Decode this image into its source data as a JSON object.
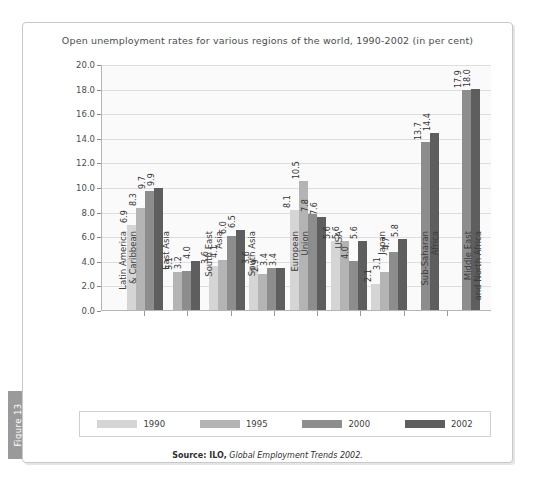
{
  "figure_tab": {
    "label": "Figure 13"
  },
  "source": {
    "lead": "Source: ILO,",
    "italic": "Global Employment Trends 2002."
  },
  "legend": {
    "items": [
      {
        "label": "1990",
        "color": "#d5d5d5"
      },
      {
        "label": "1995",
        "color": "#b4b4b4"
      },
      {
        "label": "2000",
        "color": "#8d8d8d"
      },
      {
        "label": "2002",
        "color": "#5e5e5e"
      }
    ]
  },
  "chart_data": {
    "type": "bar",
    "title": "Open unemployment rates for various regions of the world, 1990-2002 (in per cent)",
    "xlabel": "",
    "ylabel": "",
    "ylim": [
      0,
      20
    ],
    "ytick_step": 2,
    "grid": true,
    "legend_position": "bottom",
    "yticks": [
      "0.0",
      "2.0",
      "4.0",
      "6.0",
      "8.0",
      "10.0",
      "12.0",
      "14.0",
      "16.0",
      "18.0",
      "20.0"
    ],
    "categories": [
      {
        "line1": "Latin America",
        "line2": "& Caribbean"
      },
      {
        "line1": "East Asia",
        "line2": ""
      },
      {
        "line1": "South East",
        "line2": "Asia"
      },
      {
        "line1": "South Asia",
        "line2": ""
      },
      {
        "line1": "European",
        "line2": "Union"
      },
      {
        "line1": "USA",
        "line2": ""
      },
      {
        "line1": "Japan",
        "line2": ""
      },
      {
        "line1": "Sub-Saharan",
        "line2": "Africa"
      },
      {
        "line1": "Middle East",
        "line2": "and North Africa"
      }
    ],
    "series": [
      {
        "name": "1990",
        "color": "#d5d5d5",
        "values": [
          6.9,
          null,
          3.6,
          3.6,
          8.1,
          5.6,
          2.1,
          null,
          null
        ]
      },
      {
        "name": "1995",
        "color": "#b4b4b4",
        "values": [
          8.3,
          3.1,
          4.1,
          2.9,
          10.5,
          5.6,
          3.1,
          null,
          null
        ]
      },
      {
        "name": "2000",
        "color": "#8d8d8d",
        "values": [
          9.7,
          3.2,
          6.0,
          3.4,
          7.8,
          4.0,
          4.7,
          13.7,
          17.9
        ]
      },
      {
        "name": "2002",
        "color": "#5e5e5e",
        "values": [
          9.9,
          4.0,
          6.5,
          3.4,
          7.6,
          5.6,
          5.8,
          14.4,
          18.0
        ]
      }
    ]
  }
}
